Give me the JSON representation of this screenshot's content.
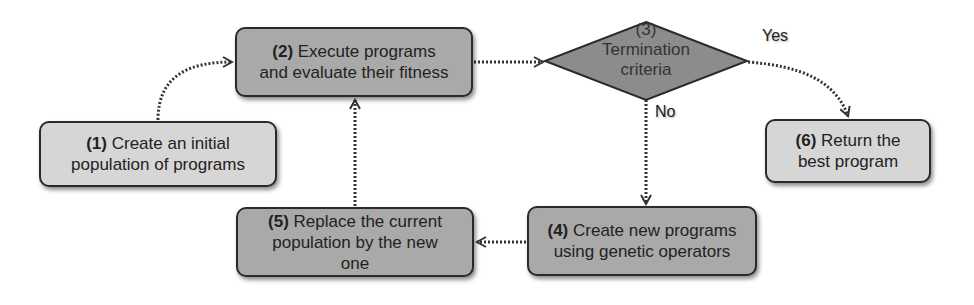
{
  "diagram": {
    "type": "flowchart",
    "colors": {
      "light_node": "#d6d6d6",
      "dark_node": "#a9a9a9",
      "decision_node": "#8c8c8c",
      "border": "#2a2a2a",
      "edge": "#333333"
    },
    "nodes": [
      {
        "id": "1",
        "number": "(1)",
        "text_line1": "Create an initial",
        "text_line2": "population of programs",
        "shape": "rounded-rect",
        "fill": "light"
      },
      {
        "id": "2",
        "number": "(2)",
        "text_line1": "Execute programs",
        "text_line2": "and evaluate their fitness",
        "shape": "rounded-rect",
        "fill": "dark"
      },
      {
        "id": "3",
        "number": "(3)",
        "text_line1": "Termination",
        "text_line2": "criteria",
        "shape": "diamond",
        "fill": "decision"
      },
      {
        "id": "4",
        "number": "(4)",
        "text_line1": "Create new programs",
        "text_line2": "using genetic operators",
        "shape": "rounded-rect",
        "fill": "dark"
      },
      {
        "id": "5",
        "number": "(5)",
        "text_line1": "Replace the current",
        "text_line2": "population by the new",
        "text_line3": "one",
        "shape": "rounded-rect",
        "fill": "dark"
      },
      {
        "id": "6",
        "number": "(6)",
        "text_line1": "Return the",
        "text_line2": "best program",
        "shape": "rounded-rect",
        "fill": "light"
      }
    ],
    "edges": [
      {
        "from": "1",
        "to": "2",
        "label": ""
      },
      {
        "from": "2",
        "to": "3",
        "label": ""
      },
      {
        "from": "3",
        "to": "6",
        "label": "Yes"
      },
      {
        "from": "3",
        "to": "4",
        "label": "No"
      },
      {
        "from": "4",
        "to": "5",
        "label": ""
      },
      {
        "from": "5",
        "to": "2",
        "label": ""
      }
    ]
  }
}
